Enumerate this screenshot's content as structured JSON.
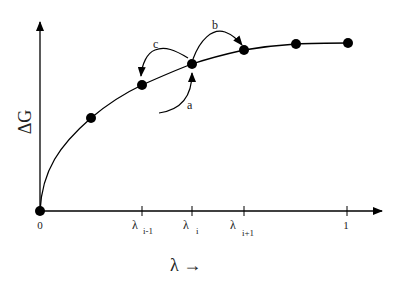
{
  "diagram": {
    "y_axis_label": "ΔG",
    "x_axis_label": "λ →",
    "ticks": [
      {
        "main": "0",
        "sub": "",
        "x": 40
      },
      {
        "main": "λ",
        "sub": "i-1",
        "x": 142
      },
      {
        "main": "λ",
        "sub": "i",
        "x": 192
      },
      {
        "main": "λ",
        "sub": "i+1",
        "x": 244
      },
      {
        "main": "1",
        "sub": "",
        "x": 347
      }
    ],
    "points": [
      {
        "x": 40,
        "y": 211
      },
      {
        "x": 91,
        "y": 118
      },
      {
        "x": 142,
        "y": 85
      },
      {
        "x": 192,
        "y": 64
      },
      {
        "x": 244,
        "y": 50
      },
      {
        "x": 296,
        "y": 44
      },
      {
        "x": 348,
        "y": 43
      }
    ],
    "arrows": [
      {
        "label": "a",
        "description": "arrow from below into point λi"
      },
      {
        "label": "b",
        "description": "arrow from λi to λi+1"
      },
      {
        "label": "c",
        "description": "arrow from λi to λi-1"
      }
    ],
    "colors": {
      "ink": "#000000",
      "background": "#ffffff"
    }
  }
}
